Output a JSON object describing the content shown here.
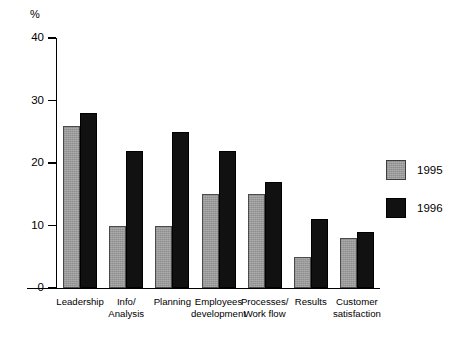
{
  "chart_data": {
    "type": "bar",
    "title": "",
    "xlabel": "",
    "ylabel": "%",
    "ylim": [
      0,
      40
    ],
    "yticks": [
      0,
      10,
      20,
      30,
      40
    ],
    "grid": false,
    "legend_position": "right",
    "categories": [
      "Leadership",
      "Info/\nAnalysis",
      "Planning",
      "Employees\ndevelopment",
      "Processes/\nWork flow",
      "Results",
      "Customer\nsatisfaction"
    ],
    "category_lines": [
      [
        "Leadership",
        ""
      ],
      [
        "Info/",
        "Analysis"
      ],
      [
        "Planning",
        ""
      ],
      [
        "Employees",
        "development"
      ],
      [
        "Processes/",
        "Work flow"
      ],
      [
        "Results",
        ""
      ],
      [
        "Customer",
        "satisfaction"
      ]
    ],
    "series": [
      {
        "name": "1995",
        "color": "#9a9a9a",
        "values": [
          26,
          10,
          10,
          15,
          15,
          5,
          8
        ]
      },
      {
        "name": "1996",
        "color": "#111111",
        "values": [
          28,
          22,
          25,
          22,
          17,
          11,
          9
        ]
      }
    ]
  },
  "axis": {
    "unit_label": "%",
    "tick_labels": [
      "0",
      "10",
      "20",
      "30",
      "40"
    ]
  },
  "legend": {
    "items": [
      {
        "label": "1995"
      },
      {
        "label": "1996"
      }
    ]
  }
}
